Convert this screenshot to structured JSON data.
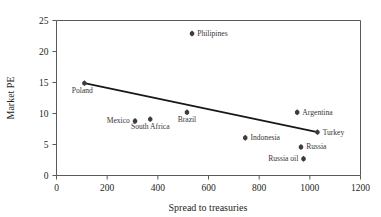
{
  "chart_data": {
    "type": "scatter",
    "title": "",
    "xlabel": "Spread to treasuries",
    "ylabel": "Market PE",
    "xlim": [
      0,
      1200
    ],
    "ylim": [
      0,
      25
    ],
    "xticks": [
      0,
      200,
      400,
      600,
      800,
      1000,
      1200
    ],
    "yticks": [
      0,
      5,
      10,
      15,
      20,
      25
    ],
    "grid": false,
    "legend": null,
    "points": [
      {
        "label": "Poland",
        "x": 110,
        "y": 14.9,
        "label_pos": "below-left"
      },
      {
        "label": "Mexico",
        "x": 310,
        "y": 8.8,
        "label_pos": "left"
      },
      {
        "label": "South Africa",
        "x": 370,
        "y": 9.1,
        "label_pos": "below"
      },
      {
        "label": "Brazil",
        "x": 515,
        "y": 10.2,
        "label_pos": "below"
      },
      {
        "label": "Philipines",
        "x": 535,
        "y": 22.9,
        "label_pos": "right"
      },
      {
        "label": "Indonesia",
        "x": 745,
        "y": 6.1,
        "label_pos": "right"
      },
      {
        "label": "Argentina",
        "x": 950,
        "y": 10.2,
        "label_pos": "right"
      },
      {
        "label": "Russia",
        "x": 965,
        "y": 4.6,
        "label_pos": "right"
      },
      {
        "label": "Russia oil",
        "x": 975,
        "y": 2.7,
        "label_pos": "left"
      },
      {
        "label": "Turkey",
        "x": 1030,
        "y": 7.0,
        "label_pos": "right"
      }
    ],
    "trendline": {
      "x_start": 110,
      "y_start": 14.9,
      "x_end": 1030,
      "y_end": 7.0
    },
    "colors": {
      "marker": "#3f3a3b",
      "trendline": "#1a1718",
      "axis": "#58595b",
      "text": "#231f20",
      "point_label": "#3a3536",
      "background": "#ffffff"
    }
  },
  "axis": {
    "x_title": "Spread to treasuries",
    "y_title": "Market PE",
    "x_tick_labels": [
      "0",
      "200",
      "400",
      "600",
      "800",
      "1000",
      "1200"
    ],
    "y_tick_labels": [
      "0",
      "5",
      "10",
      "15",
      "20",
      "25"
    ]
  }
}
